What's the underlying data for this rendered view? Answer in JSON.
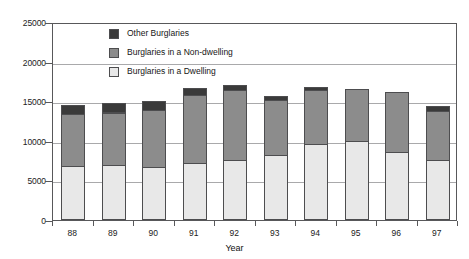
{
  "chart_data": {
    "type": "bar",
    "stacked": true,
    "title": "",
    "subtitle": "",
    "xlabel": "Year",
    "ylabel": "",
    "categories": [
      "88",
      "89",
      "90",
      "91",
      "92",
      "93",
      "94",
      "95",
      "96",
      "97"
    ],
    "ylim": [
      0,
      25000
    ],
    "ytick_values": [
      0,
      5000,
      10000,
      15000,
      20000,
      25000
    ],
    "ytick_labels": [
      "0",
      "5000",
      "10000",
      "15000",
      "20000",
      "25000"
    ],
    "grid": "horizontal",
    "legend_position": "top-center-inside",
    "series": [
      {
        "name": "Burglaries in a Dwelling",
        "color": "#e8e8e8",
        "values": [
          6700,
          6800,
          6600,
          7050,
          7400,
          8050,
          9500,
          9900,
          8500,
          7500
        ]
      },
      {
        "name": "Burglaries in a Non-dwelling",
        "color": "#8c8c8c",
        "values": [
          6600,
          6650,
          7150,
          8600,
          8900,
          6950,
          6800,
          6500,
          7500,
          6200
        ]
      },
      {
        "name": "Other Burglaries",
        "color": "#3a3a3a",
        "values": [
          1100,
          1200,
          1100,
          900,
          600,
          550,
          400,
          0,
          0,
          600
        ]
      }
    ],
    "totals": [
      14400,
      14650,
      14850,
      16550,
      16900,
      15550,
      16700,
      16400,
      16000,
      14300
    ]
  },
  "legend": {
    "entries": [
      {
        "label": "Other Burglaries",
        "color": "#3a3a3a"
      },
      {
        "label": "Burglaries in a Non-dwelling",
        "color": "#8c8c8c"
      },
      {
        "label": "Burglaries in a Dwelling",
        "color": "#e8e8e8"
      }
    ]
  },
  "axes": {
    "x_title": "Year"
  }
}
